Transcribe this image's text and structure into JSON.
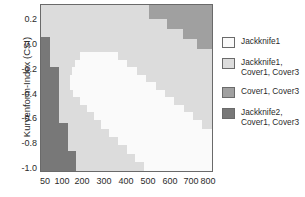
{
  "chart_data": {
    "type": "heatmap",
    "title": "",
    "xlabel": "",
    "ylabel": "Kurvenform-Index (CSI)",
    "grid": false,
    "legend_position": "right",
    "x": [
      50,
      100,
      200,
      300,
      400,
      500,
      600,
      700,
      800
    ],
    "xtick_labels": [
      "50",
      "100",
      "200",
      "300",
      "400",
      "500",
      "600",
      "700",
      "800"
    ],
    "xlim": [
      20,
      850
    ],
    "y": [
      0.2,
      0.0,
      -0.2,
      -0.4,
      -0.6,
      -0.8,
      -1.0
    ],
    "ytick_labels": [
      "0.2",
      "0.0",
      "-0.2",
      "-0.4",
      "-0.6",
      "-0.8",
      "-1.0"
    ],
    "ylim": [
      -1.05,
      0.3
    ],
    "categories": [
      "Jackknife1",
      "Jackknife1, Cover1, Cover3",
      "Cover1, Cover3",
      "Jackknife2, Cover1, Cover3"
    ],
    "colors": [
      "#fafafa",
      "#dcdcdc",
      "#a0a0a0",
      "#787878"
    ],
    "region_notes": [
      "Background region fill is the light grey class (Jackknife1, Cover1, Cover3).",
      "White class (Jackknife1) forms a wide diagonal band from upper-left-centre to lower-right.",
      "Medium grey class (Cover1, Cover3) occupies the upper-right staircase corner.",
      "Dark grey class (Jackknife2, Cover1, Cover3) occupies a staircase strip along the left edge below CSI 0.0."
    ],
    "regions": {
      "medium_grey_top_right_steps": [
        {
          "x_start_pct": 63.0,
          "x_end_pct": 100.0,
          "y_top_pct": 0.0,
          "y_bottom_pct": 8.5
        },
        {
          "x_start_pct": 73.5,
          "x_end_pct": 100.0,
          "y_top_pct": 8.5,
          "y_bottom_pct": 14.5
        },
        {
          "x_start_pct": 83.0,
          "x_end_pct": 100.0,
          "y_top_pct": 14.5,
          "y_bottom_pct": 20.5
        },
        {
          "x_start_pct": 91.5,
          "x_end_pct": 100.0,
          "y_top_pct": 20.5,
          "y_bottom_pct": 26.5
        }
      ],
      "dark_grey_left_steps": [
        {
          "x_start_pct": 0.0,
          "x_end_pct": 5.0,
          "y_top_pct": 19.5,
          "y_bottom_pct": 37.5
        },
        {
          "x_start_pct": 0.0,
          "x_end_pct": 10.5,
          "y_top_pct": 37.5,
          "y_bottom_pct": 71.0
        },
        {
          "x_start_pct": 0.0,
          "x_end_pct": 15.5,
          "y_top_pct": 71.0,
          "y_bottom_pct": 88.0
        },
        {
          "x_start_pct": 0.0,
          "x_end_pct": 20.5,
          "y_top_pct": 88.0,
          "y_bottom_pct": 100.0
        }
      ],
      "white_band_steps": [
        {
          "x_start_pct": 23.0,
          "x_end_pct": 45.0,
          "y_top_pct": 28.5,
          "y_bottom_pct": 33.0
        },
        {
          "x_start_pct": 20.0,
          "x_end_pct": 50.5,
          "y_top_pct": 33.0,
          "y_bottom_pct": 37.5
        },
        {
          "x_start_pct": 18.0,
          "x_end_pct": 56.0,
          "y_top_pct": 37.5,
          "y_bottom_pct": 42.0
        },
        {
          "x_start_pct": 17.0,
          "x_end_pct": 61.5,
          "y_top_pct": 42.0,
          "y_bottom_pct": 46.5
        },
        {
          "x_start_pct": 17.0,
          "x_end_pct": 67.0,
          "y_top_pct": 46.5,
          "y_bottom_pct": 51.0
        },
        {
          "x_start_pct": 19.0,
          "x_end_pct": 72.5,
          "y_top_pct": 51.0,
          "y_bottom_pct": 55.5
        },
        {
          "x_start_pct": 23.0,
          "x_end_pct": 78.0,
          "y_top_pct": 55.5,
          "y_bottom_pct": 60.0
        },
        {
          "x_start_pct": 27.0,
          "x_end_pct": 83.5,
          "y_top_pct": 60.0,
          "y_bottom_pct": 64.5
        },
        {
          "x_start_pct": 31.0,
          "x_end_pct": 89.0,
          "y_top_pct": 64.5,
          "y_bottom_pct": 69.5
        },
        {
          "x_start_pct": 35.0,
          "x_end_pct": 94.0,
          "y_top_pct": 69.5,
          "y_bottom_pct": 74.5
        },
        {
          "x_start_pct": 40.0,
          "x_end_pct": 100.0,
          "y_top_pct": 74.5,
          "y_bottom_pct": 79.5
        },
        {
          "x_start_pct": 45.0,
          "x_end_pct": 100.0,
          "y_top_pct": 79.5,
          "y_bottom_pct": 84.5
        },
        {
          "x_start_pct": 50.0,
          "x_end_pct": 100.0,
          "y_top_pct": 84.5,
          "y_bottom_pct": 89.5
        },
        {
          "x_start_pct": 55.0,
          "x_end_pct": 100.0,
          "y_top_pct": 89.5,
          "y_bottom_pct": 94.5
        },
        {
          "x_start_pct": 60.0,
          "x_end_pct": 100.0,
          "y_top_pct": 94.5,
          "y_bottom_pct": 100.0
        }
      ]
    }
  },
  "axes": {
    "ylabel": "Kurvenform-Index (CSI)",
    "yticks": [
      {
        "label": "0.2",
        "pos_pct": 8.9
      },
      {
        "label": "0.0",
        "pos_pct": 23.7
      },
      {
        "label": "-0.2",
        "pos_pct": 38.5
      },
      {
        "label": "-0.4",
        "pos_pct": 53.3
      },
      {
        "label": "-0.6",
        "pos_pct": 68.1
      },
      {
        "label": "-0.8",
        "pos_pct": 82.9
      },
      {
        "label": "-1.0",
        "pos_pct": 97.7
      }
    ],
    "xticks": [
      {
        "label": "50",
        "px": 45
      },
      {
        "label": "100",
        "px": 62
      },
      {
        "label": "200",
        "px": 82
      },
      {
        "label": "300",
        "px": 104
      },
      {
        "label": "400",
        "px": 126
      },
      {
        "label": "500",
        "px": 148
      },
      {
        "label": "600",
        "px": 170
      },
      {
        "label": "700",
        "px": 191
      },
      {
        "label": "800",
        "px": 208
      }
    ]
  },
  "legend": {
    "items": [
      {
        "label": "Jackknife1",
        "color": "#fafafa"
      },
      {
        "label": "Jackknife1,\nCover1, Cover3",
        "color": "#dcdcdc"
      },
      {
        "label": "Cover1, Cover3",
        "color": "#a0a0a0"
      },
      {
        "label": "Jackknife2,\nCover1, Cover3",
        "color": "#787878"
      }
    ]
  }
}
